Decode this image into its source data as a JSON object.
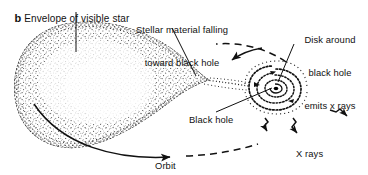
{
  "figure": {
    "panel_letter": "b",
    "panel_title": "Envelope of visible star",
    "type": "astronomy-diagram",
    "background_color": "#ffffff",
    "ink_color": "#111111"
  },
  "labels": {
    "envelope": "Envelope of visible star",
    "stellar_material_line1": "Stellar material falling",
    "stellar_material_line2": "toward black hole",
    "disk_line1": "Disk around",
    "disk_line2": "black hole",
    "disk_line3": "emits x rays",
    "black_hole": "Black hole",
    "orbit": "Orbit",
    "x_rays": "X rays"
  },
  "elements": {
    "star_name": "visible-star-envelope",
    "star_shape": "teardrop Roche lobe, stippled",
    "disk_name": "accretion-disk",
    "disk_shape": "double spiral with dark core",
    "stream_name": "accretion-stream",
    "orbit_name": "orbit-path",
    "xray_name": "x-ray-arrows",
    "xray_arrow_count": 3
  }
}
